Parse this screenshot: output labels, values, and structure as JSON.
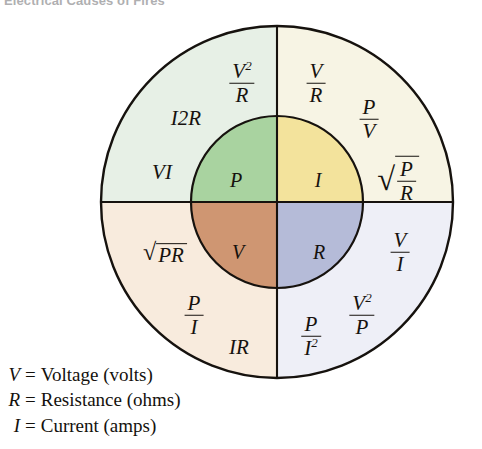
{
  "page": {
    "title": "Electrical Causes of Fires",
    "background": "#ffffff"
  },
  "diagram": {
    "name": "electrical-formula-wheel",
    "stroke": "#16120e",
    "center": {
      "x": 277,
      "y": 202
    },
    "outer_radius": 176,
    "inner_radius": 86,
    "inner_quadrants": [
      {
        "id": "power",
        "symbol": "P",
        "position": "top-left",
        "color": "#a9d3a0"
      },
      {
        "id": "current",
        "symbol": "I",
        "position": "top-right",
        "color": "#f3e39c"
      },
      {
        "id": "voltage",
        "symbol": "V",
        "position": "bottom-left",
        "color": "#cf9672"
      },
      {
        "id": "resistance",
        "symbol": "R",
        "position": "bottom-right",
        "color": "#b5bbd8"
      }
    ],
    "outer_quadrants": [
      {
        "id": "power-formulas",
        "position": "top-left",
        "color": "#e7f0e6",
        "for_symbol": "P",
        "formulas": [
          {
            "id": "v-squared-over-r",
            "type": "fraction",
            "num": "V2",
            "den": "R"
          },
          {
            "id": "i-squared-r",
            "type": "plain",
            "text": "I2R"
          },
          {
            "id": "v-times-i",
            "type": "plain",
            "text": "VI"
          }
        ]
      },
      {
        "id": "current-formulas",
        "position": "top-right",
        "color": "#f7f4e4",
        "for_symbol": "I",
        "formulas": [
          {
            "id": "v-over-r",
            "type": "fraction",
            "num": "V",
            "den": "R"
          },
          {
            "id": "p-over-v",
            "type": "fraction",
            "num": "P",
            "den": "V"
          },
          {
            "id": "sqrt-p-over-r",
            "type": "sqrt-fraction",
            "num": "P",
            "den": "R"
          }
        ]
      },
      {
        "id": "voltage-formulas",
        "position": "bottom-left",
        "color": "#f8ebdd",
        "for_symbol": "V",
        "formulas": [
          {
            "id": "sqrt-pr",
            "type": "sqrt",
            "text": "PR"
          },
          {
            "id": "p-over-i",
            "type": "fraction",
            "num": "P",
            "den": "I"
          },
          {
            "id": "i-times-r",
            "type": "plain",
            "text": "IR"
          }
        ]
      },
      {
        "id": "resistance-formulas",
        "position": "bottom-right",
        "color": "#eeeff7",
        "for_symbol": "R",
        "formulas": [
          {
            "id": "v-over-i",
            "type": "fraction",
            "num": "V",
            "den": "I"
          },
          {
            "id": "v-squared-over-p",
            "type": "fraction",
            "num": "V2",
            "den": "P"
          },
          {
            "id": "p-over-i-squared",
            "type": "fraction",
            "num": "P",
            "den": "I2"
          }
        ]
      }
    ]
  },
  "legend": {
    "rows": [
      {
        "symbol": "V",
        "equals": "=",
        "text": "Voltage (volts)"
      },
      {
        "symbol": "R",
        "equals": "=",
        "text": "Resistance (ohms)"
      },
      {
        "symbol": "I",
        "equals": "=",
        "text": "Current (amps)"
      }
    ]
  }
}
